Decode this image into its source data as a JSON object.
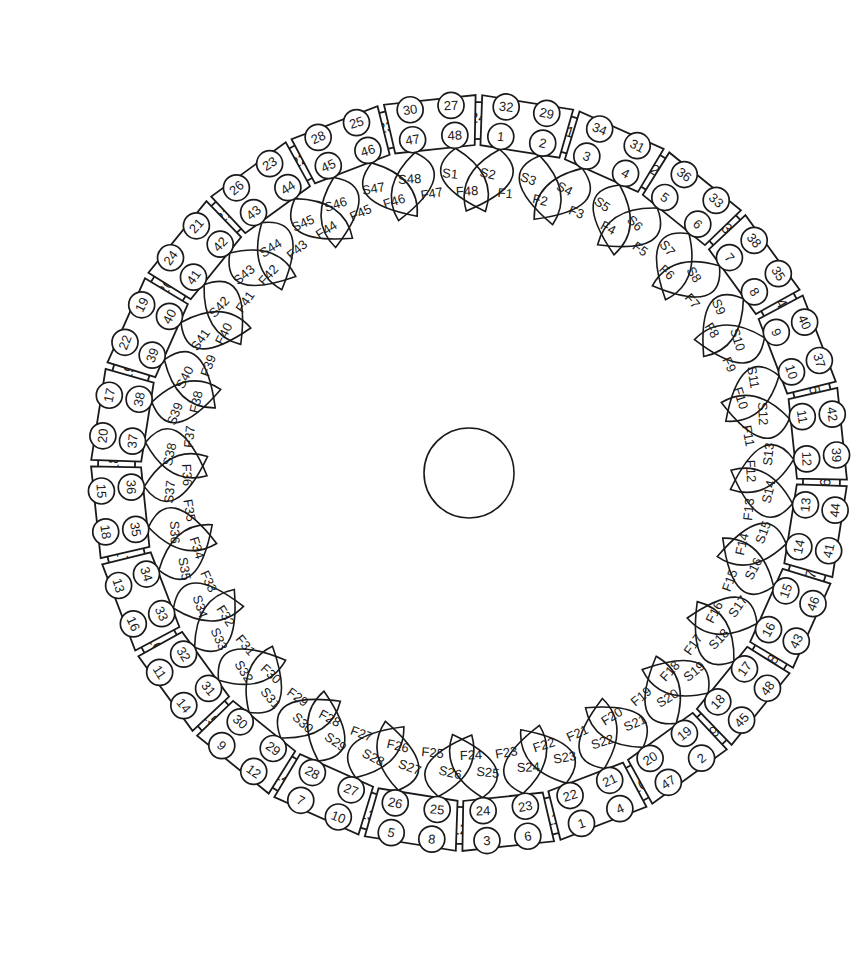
{
  "diagram": {
    "type": "stator-winding-diagram",
    "slot_count": 24,
    "coil_count": 48,
    "center_hub": {
      "shape": "circle",
      "label": ""
    },
    "colors": {
      "line": "#1a1a1a",
      "background": "#ffffff"
    },
    "slots": [
      {
        "slot": "1"
      },
      {
        "slot": "2"
      },
      {
        "slot": "3"
      },
      {
        "slot": "4"
      },
      {
        "slot": "5"
      },
      {
        "slot": "6"
      },
      {
        "slot": "7"
      },
      {
        "slot": "8"
      },
      {
        "slot": "9"
      },
      {
        "slot": "10"
      },
      {
        "slot": "11"
      },
      {
        "slot": "12"
      },
      {
        "slot": "13"
      },
      {
        "slot": "14"
      },
      {
        "slot": "15"
      },
      {
        "slot": "16"
      },
      {
        "slot": "17"
      },
      {
        "slot": "18"
      },
      {
        "slot": "19"
      },
      {
        "slot": "20"
      },
      {
        "slot": "21"
      },
      {
        "slot": "22"
      },
      {
        "slot": "23"
      },
      {
        "slot": "24"
      }
    ],
    "coil_groups": [
      {
        "after_slot": "24",
        "inner": [
          "1",
          "2"
        ],
        "outer": [
          "32",
          "29"
        ],
        "leads": [
          "S1",
          "F1",
          "S2",
          "F2"
        ]
      },
      {
        "after_slot": "1",
        "inner": [
          "3",
          "4"
        ],
        "outer": [
          "34",
          "31"
        ],
        "leads": [
          "S3",
          "F3",
          "S4",
          "F4"
        ]
      },
      {
        "after_slot": "2",
        "inner": [
          "5",
          "6"
        ],
        "outer": [
          "36",
          "33"
        ],
        "leads": [
          "S5",
          "F5",
          "S6",
          "F6"
        ]
      },
      {
        "after_slot": "3",
        "inner": [
          "7",
          "8"
        ],
        "outer": [
          "38",
          "35"
        ],
        "leads": [
          "S7",
          "F7",
          "S8",
          "F8"
        ]
      },
      {
        "after_slot": "4",
        "inner": [
          "9",
          "10"
        ],
        "outer": [
          "40",
          "37"
        ],
        "leads": [
          "S9",
          "F9",
          "S10",
          "F10"
        ]
      },
      {
        "after_slot": "5",
        "inner": [
          "11",
          "12"
        ],
        "outer": [
          "42",
          "39"
        ],
        "leads": [
          "S11",
          "F11",
          "S12",
          "F12"
        ]
      },
      {
        "after_slot": "6",
        "inner": [
          "13",
          "14"
        ],
        "outer": [
          "44",
          "41"
        ],
        "leads": [
          "S13",
          "F13",
          "S14",
          "F14"
        ]
      },
      {
        "after_slot": "7",
        "inner": [
          "15",
          "16"
        ],
        "outer": [
          "46",
          "43"
        ],
        "leads": [
          "S15",
          "F15",
          "S16",
          "F16"
        ]
      },
      {
        "after_slot": "8",
        "inner": [
          "17",
          "18"
        ],
        "outer": [
          "48",
          "45"
        ],
        "leads": [
          "S17",
          "F17",
          "S18",
          "F18"
        ]
      },
      {
        "after_slot": "9",
        "inner": [
          "19",
          "20"
        ],
        "outer": [
          "2",
          "47"
        ],
        "leads": [
          "S19",
          "F19",
          "S20",
          "F20"
        ]
      },
      {
        "after_slot": "10",
        "inner": [
          "21",
          "22"
        ],
        "outer": [
          "4",
          "1"
        ],
        "leads": [
          "S21",
          "F21",
          "S22",
          "F22"
        ]
      },
      {
        "after_slot": "11",
        "inner": [
          "23",
          "24"
        ],
        "outer": [
          "6",
          "3"
        ],
        "leads": [
          "S23",
          "F23",
          "S24",
          "F24"
        ]
      },
      {
        "after_slot": "12",
        "inner": [
          "25",
          "26"
        ],
        "outer": [
          "8",
          "5"
        ],
        "leads": [
          "S25",
          "F25",
          "S26",
          "F26"
        ]
      },
      {
        "after_slot": "13",
        "inner": [
          "27",
          "28"
        ],
        "outer": [
          "10",
          "7"
        ],
        "leads": [
          "S27",
          "F27",
          "S28",
          "F28"
        ]
      },
      {
        "after_slot": "14",
        "inner": [
          "29",
          "30"
        ],
        "outer": [
          "12",
          "9"
        ],
        "leads": [
          "S29",
          "F29",
          "S30",
          "F30"
        ]
      },
      {
        "after_slot": "15",
        "inner": [
          "31",
          "32"
        ],
        "outer": [
          "14",
          "11"
        ],
        "leads": [
          "S31",
          "F31",
          "S32",
          "F32"
        ]
      },
      {
        "after_slot": "16",
        "inner": [
          "33",
          "34"
        ],
        "outer": [
          "16",
          "13"
        ],
        "leads": [
          "S33",
          "F33",
          "S34",
          "F34"
        ]
      },
      {
        "after_slot": "17",
        "inner": [
          "35",
          "36"
        ],
        "outer": [
          "18",
          "15"
        ],
        "leads": [
          "S35",
          "F35",
          "S36",
          "F36"
        ]
      },
      {
        "after_slot": "18",
        "inner": [
          "37",
          "38"
        ],
        "outer": [
          "20",
          "17"
        ],
        "leads": [
          "S37",
          "F37",
          "S38",
          "F38"
        ]
      },
      {
        "after_slot": "19",
        "inner": [
          "39",
          "40"
        ],
        "outer": [
          "22",
          "19"
        ],
        "leads": [
          "S39",
          "F39",
          "S40",
          "F40"
        ]
      },
      {
        "after_slot": "20",
        "inner": [
          "41",
          "42"
        ],
        "outer": [
          "24",
          "21"
        ],
        "leads": [
          "S41",
          "F41",
          "S42",
          "F42"
        ]
      },
      {
        "after_slot": "21",
        "inner": [
          "43",
          "44"
        ],
        "outer": [
          "26",
          "23"
        ],
        "leads": [
          "S43",
          "F43",
          "S44",
          "F44"
        ]
      },
      {
        "after_slot": "22",
        "inner": [
          "45",
          "46"
        ],
        "outer": [
          "28",
          "25"
        ],
        "leads": [
          "S45",
          "F45",
          "S46",
          "F46"
        ]
      },
      {
        "after_slot": "23",
        "inner": [
          "47",
          "48"
        ],
        "outer": [
          "30",
          "27"
        ],
        "leads": [
          "S47",
          "F47",
          "S48",
          "F48"
        ]
      }
    ]
  }
}
